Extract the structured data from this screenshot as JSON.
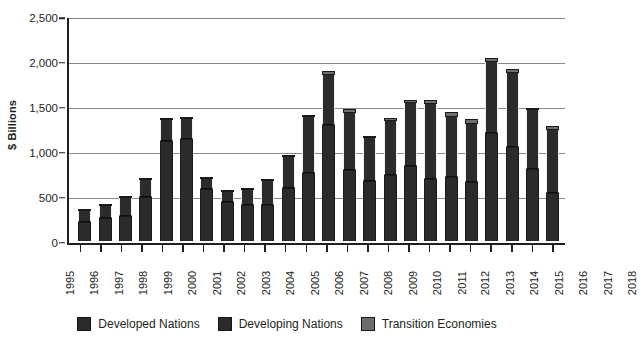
{
  "chart_data": {
    "type": "bar",
    "subtype": "stacked-bar",
    "title": "",
    "xlabel": "",
    "ylabel": "$ Billions",
    "ylim": [
      0,
      2500
    ],
    "ytick_labels": [
      "2,500",
      "2,000",
      "1,500",
      "1,000",
      "500",
      "0"
    ],
    "ytick_values": [
      2500,
      2000,
      1500,
      1000,
      500,
      0
    ],
    "grid": true,
    "grid_axis": "y",
    "legend_position": "bottom",
    "categories": [
      "1995",
      "1996",
      "1997",
      "1998",
      "1999",
      "2000",
      "2001",
      "2002",
      "2003",
      "2004",
      "2005",
      "2006",
      "2007",
      "2008",
      "2009",
      "2010",
      "2011",
      "2012",
      "2013",
      "2014",
      "2015",
      "2016",
      "2017",
      "2018"
    ],
    "series": [
      {
        "name": "Developed Nations",
        "color": "#2b2b2b",
        "values": [
          205,
          250,
          270,
          480,
          1105,
          1125,
          570,
          425,
          390,
          400,
          580,
          750,
          1285,
          790,
          660,
          725,
          825,
          690,
          710,
          650,
          1195,
          1040,
          800,
          525
        ]
      },
      {
        "name": "Developing Nations",
        "color": "#2b2b2b",
        "values": [
          125,
          140,
          205,
          190,
          240,
          225,
          115,
          120,
          170,
          265,
          355,
          625,
          560,
          625,
          480,
          610,
          710,
          830,
          670,
          650,
          790,
          830,
          650,
          705
        ]
      },
      {
        "name": "Transition Economies",
        "color": "#6e6e6e",
        "values": [
          10,
          10,
          15,
          20,
          20,
          5,
          5,
          10,
          10,
          25,
          20,
          20,
          45,
          50,
          20,
          35,
          35,
          50,
          50,
          50,
          45,
          35,
          30,
          45
        ]
      }
    ],
    "totals": [
      340,
      400,
      490,
      690,
      1365,
      1355,
      690,
      555,
      570,
      690,
      955,
      1395,
      1890,
      1465,
      1160,
      1370,
      1570,
      1570,
      1430,
      1350,
      2030,
      1905,
      1480,
      1275
    ]
  },
  "axis": {
    "y_title": "$ Billions"
  },
  "legend": {
    "items": [
      {
        "label": "Developed Nations",
        "color": "#2b2b2b"
      },
      {
        "label": "Developing Nations",
        "color": "#2b2b2b"
      },
      {
        "label": "Transition Economies",
        "color": "#6e6e6e"
      }
    ]
  }
}
